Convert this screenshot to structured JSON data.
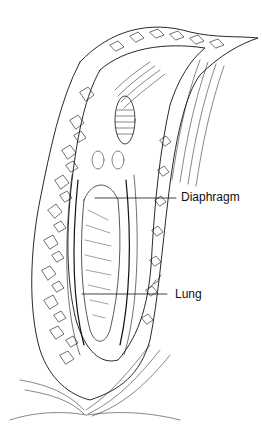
{
  "figure": {
    "type": "anatomical line drawing",
    "labels": [
      {
        "id": "diaphragm",
        "text": "Diaphragm"
      },
      {
        "id": "lung",
        "text": "Lung"
      }
    ],
    "signature": "E.L."
  },
  "colors": {
    "ink": "#111111",
    "background": "#ffffff"
  }
}
